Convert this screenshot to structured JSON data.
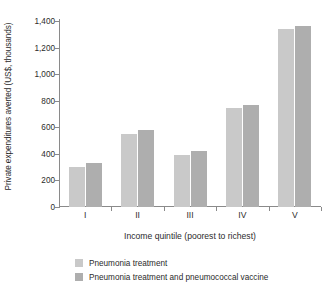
{
  "chart_data": {
    "type": "bar",
    "title": "",
    "subtitle": "",
    "xlabel": "Income quintile (poorest to richest)",
    "ylabel": "Private expenditures averted (US$, thousands)",
    "categories": [
      "I",
      "II",
      "III",
      "IV",
      "V"
    ],
    "series": [
      {
        "name": "Pneumonia treatment",
        "color": "#c9c9c9",
        "values": [
          300,
          550,
          390,
          745,
          1340
        ]
      },
      {
        "name": "Pneumonia treatment and pneumococcal vaccine",
        "color": "#aeaeae",
        "values": [
          330,
          580,
          420,
          770,
          1365
        ]
      }
    ],
    "ylim": [
      0,
      1400
    ],
    "ytick_values": [
      0,
      200,
      400,
      600,
      800,
      1000,
      1200,
      1400
    ],
    "ytick_labels": [
      "0",
      "200",
      "400",
      "600",
      "800",
      "1,000",
      "1,200",
      "1,400"
    ],
    "grid": false,
    "legend_position": "bottom-left",
    "axis_color": "#8a8a8a",
    "text_color": "#2b2b2b",
    "background": "#ffffff"
  }
}
